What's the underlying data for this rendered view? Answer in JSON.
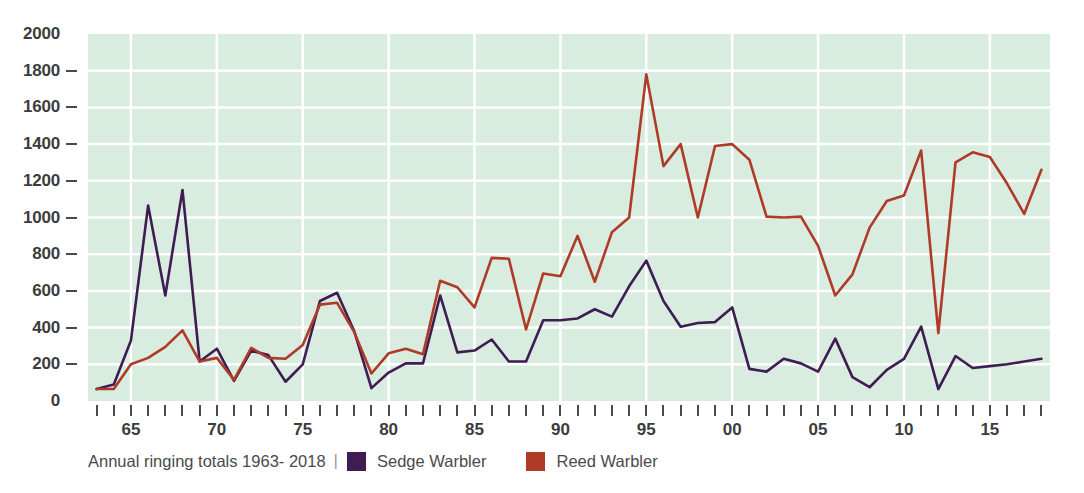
{
  "chart_data": {
    "type": "line",
    "title": "",
    "caption": "Annual ringing totals 1963- 2018",
    "xlabel": "",
    "ylabel": "",
    "ylim": [
      0,
      2000
    ],
    "xlim": [
      1963,
      2018
    ],
    "grid": true,
    "legend_position": "bottom-left",
    "y_ticks": [
      2000,
      1800,
      1600,
      1400,
      1200,
      1000,
      800,
      600,
      400,
      200,
      0
    ],
    "x_tick_labels": [
      "65",
      "70",
      "75",
      "80",
      "85",
      "90",
      "95",
      "00",
      "05",
      "10",
      "15"
    ],
    "x_tick_years": [
      1965,
      1970,
      1975,
      1980,
      1985,
      1990,
      1995,
      2000,
      2005,
      2010,
      2015
    ],
    "x": [
      1963,
      1964,
      1965,
      1966,
      1967,
      1968,
      1969,
      1970,
      1971,
      1972,
      1973,
      1974,
      1975,
      1976,
      1977,
      1978,
      1979,
      1980,
      1981,
      1982,
      1983,
      1984,
      1985,
      1986,
      1987,
      1988,
      1989,
      1990,
      1991,
      1992,
      1993,
      1994,
      1995,
      1996,
      1997,
      1998,
      1999,
      2000,
      2001,
      2002,
      2003,
      2004,
      2005,
      2006,
      2007,
      2008,
      2009,
      2010,
      2011,
      2012,
      2013,
      2014,
      2015,
      2016,
      2017,
      2018
    ],
    "series": [
      {
        "name": "Sedge Warbler",
        "color": "#3f1d52",
        "values": [
          65,
          90,
          330,
          1065,
          575,
          1150,
          215,
          285,
          110,
          275,
          250,
          105,
          200,
          545,
          590,
          380,
          70,
          155,
          205,
          205,
          575,
          265,
          275,
          335,
          215,
          215,
          440,
          440,
          450,
          500,
          460,
          625,
          765,
          545,
          405,
          425,
          430,
          510,
          175,
          160,
          230,
          205,
          160,
          340,
          130,
          75,
          170,
          230,
          405,
          65,
          245,
          180,
          190,
          200,
          215,
          230
        ]
      },
      {
        "name": "Reed Warbler",
        "color": "#b03a28",
        "values": [
          65,
          65,
          200,
          235,
          295,
          385,
          215,
          235,
          115,
          290,
          235,
          230,
          305,
          525,
          535,
          375,
          150,
          260,
          285,
          255,
          655,
          620,
          510,
          780,
          775,
          390,
          695,
          680,
          900,
          650,
          920,
          1000,
          1780,
          1280,
          1400,
          1000,
          1390,
          1400,
          1315,
          1005,
          1000,
          1005,
          845,
          575,
          690,
          945,
          1090,
          1120,
          1365,
          370,
          1300,
          1355,
          1330,
          1185,
          1020,
          1260
        ]
      }
    ]
  },
  "legend": {
    "separator": "|",
    "entries": [
      {
        "label": "Sedge Warbler",
        "color": "#3f1d52"
      },
      {
        "label": "Reed Warbler",
        "color": "#b03a28"
      }
    ]
  },
  "colors": {
    "plot_background": "#d8ecdf",
    "gridline": "#ffffff",
    "axis_text": "#3c3c3c",
    "caption_text": "#4a4a4a",
    "page_background": "#ffffff"
  }
}
